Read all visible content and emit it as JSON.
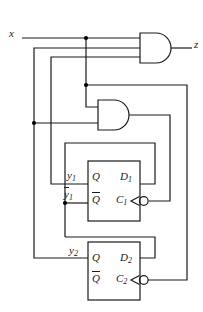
{
  "diagram": {
    "kind": "logic-circuit",
    "colors": {
      "line": "#1a1a1a",
      "background": "#ffffff",
      "junction_dot": "#000000"
    },
    "gates": [
      {
        "id": "and-top",
        "type": "AND",
        "inputs": [
          "x",
          "y2",
          "y1"
        ],
        "output": "z"
      },
      {
        "id": "and-mid",
        "type": "AND",
        "inputs": [
          "x",
          "y2"
        ],
        "output": "C1"
      }
    ],
    "junction_dots": [
      [
        86,
        38
      ],
      [
        86,
        85
      ],
      [
        34,
        123
      ],
      [
        65,
        203
      ]
    ]
  },
  "labels": {
    "x": "x",
    "z": "z",
    "y1": {
      "base": "y",
      "sub": "1"
    },
    "y1bar": {
      "base": "y",
      "sub": "1"
    },
    "y2": {
      "base": "y",
      "sub": "2"
    },
    "ff1": {
      "q": "Q",
      "qbar": "Q",
      "d": {
        "base": "D",
        "sub": "1"
      },
      "c": {
        "base": "C",
        "sub": "1"
      }
    },
    "ff2": {
      "q": "Q",
      "qbar": "Q",
      "d": {
        "base": "D",
        "sub": "2"
      },
      "c": {
        "base": "C",
        "sub": "2"
      }
    }
  }
}
